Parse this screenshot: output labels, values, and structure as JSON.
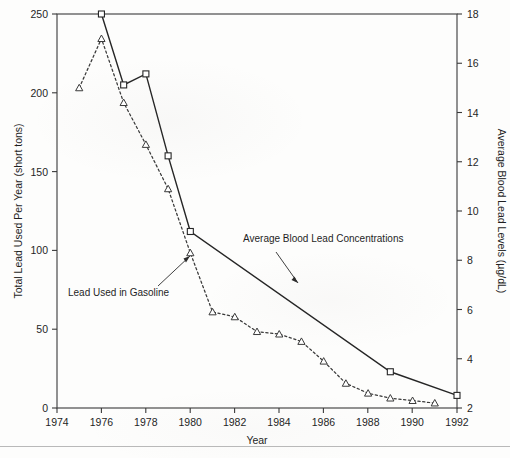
{
  "chart_data": {
    "type": "line",
    "title": "",
    "xlabel": "Year",
    "ylabel": "Total Lead Used Per Year (short tons)",
    "y2label": "Average Blood Lead Levels (µg/dL)",
    "xlim": [
      1974,
      1992
    ],
    "ylim": [
      0,
      250
    ],
    "y2lim": [
      2,
      18
    ],
    "grid": false,
    "legend_position": "inline-annotations",
    "xticks": [
      1974,
      1976,
      1978,
      1980,
      1982,
      1984,
      1986,
      1988,
      1990,
      1992
    ],
    "yticks": [
      0,
      50,
      100,
      150,
      200,
      250
    ],
    "y2ticks": [
      2,
      4,
      6,
      8,
      10,
      12,
      14,
      16,
      18
    ],
    "series": [
      {
        "name": "Lead Used in Gasoline",
        "axis": "left",
        "marker": "square",
        "linestyle": "solid",
        "units": "short tons (thousands)",
        "x": [
          1976,
          1977,
          1978,
          1979,
          1980,
          1989,
          1992
        ],
        "values": [
          250,
          205,
          212,
          160,
          112,
          23,
          8
        ]
      },
      {
        "name": "Average Blood Lead Concentrations",
        "axis": "right",
        "marker": "triangle",
        "linestyle": "dashed",
        "units": "µg/dL",
        "x": [
          1975,
          1976,
          1977,
          1978,
          1979,
          1980,
          1981,
          1982,
          1983,
          1984,
          1985,
          1986,
          1987,
          1988,
          1989,
          1990,
          1991
        ],
        "values": [
          15.0,
          17.0,
          14.4,
          12.7,
          10.9,
          8.3,
          5.9,
          5.7,
          5.1,
          5.0,
          4.7,
          3.9,
          3.0,
          2.6,
          2.4,
          2.3,
          2.2
        ]
      }
    ],
    "annotations": [
      {
        "text": "Lead Used in Gasoline",
        "target_series": "Lead Used in Gasoline"
      },
      {
        "text": "Average Blood Lead Concentrations",
        "target_series": "Average Blood Lead Concentrations"
      }
    ]
  }
}
